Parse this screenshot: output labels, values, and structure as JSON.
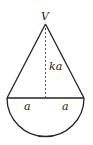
{
  "diagram": {
    "type": "geometry-figure",
    "labels": {
      "apex": "V",
      "height": "ka",
      "left_radius": "a",
      "right_radius": "a"
    },
    "colors": {
      "stroke": "#222222",
      "background": "#ffffff"
    }
  }
}
